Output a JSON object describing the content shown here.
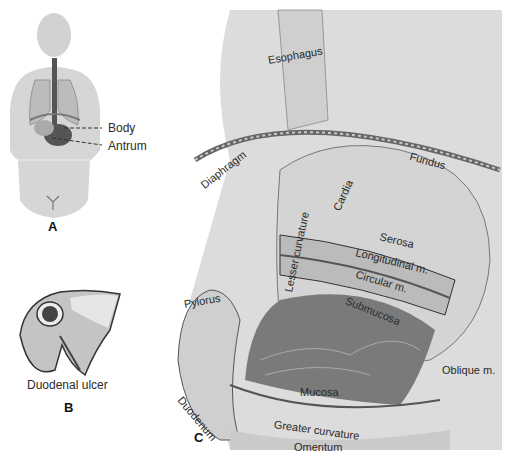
{
  "figure": {
    "panels": [
      {
        "id": "A",
        "letter": "A",
        "description": "Body silhouette showing stomach location",
        "labels": {
          "body": "Body",
          "antrum": "Antrum"
        }
      },
      {
        "id": "B",
        "letter": "B",
        "caption": "Duodenal ulcer"
      },
      {
        "id": "C",
        "letter": "C",
        "description": "Cutaway of stomach wall layers",
        "labels": {
          "esophagus": "Esophagus",
          "diaphragm": "Diaphragm",
          "cardia": "Cardia",
          "fundus": "Fundus",
          "lesser_curvature": "Lesser curvature",
          "serosa": "Serosa",
          "longitudinal": "Longitudinal m.",
          "circular": "Circular m.",
          "submucosa": "Submucosa",
          "oblique": "Oblique m.",
          "pylorus": "Pylorus",
          "mucosa": "Mucosa",
          "duodenum": "Duodenum",
          "greater_curvature": "Greater curvature",
          "omentum": "Omentum"
        }
      }
    ],
    "colors": {
      "line": "#2a2a2a",
      "shade_dark": "#6a6a6a",
      "shade_mid": "#a8a8a8",
      "shade_light": "#d8d8d8",
      "bg": "#ffffff"
    }
  }
}
